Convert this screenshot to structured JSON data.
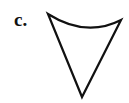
{
  "figure": {
    "label": "c.",
    "shape": {
      "description": "curved-top inverted triangle",
      "stroke_color": "#111111",
      "fill_color": "#ffffff",
      "vertices": {
        "top_left": [
          48,
          14
        ],
        "top_right": [
          121,
          20
        ],
        "bottom": [
          82,
          97
        ]
      },
      "top_edge": "concave curve"
    }
  }
}
